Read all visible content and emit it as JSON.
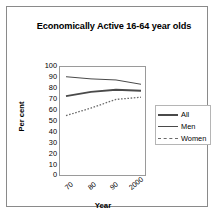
{
  "chart_data": {
    "type": "line",
    "title": "Economically Active 16-64 year olds",
    "xlabel": "Year",
    "ylabel": "Per cent",
    "ylim": [
      0,
      100
    ],
    "ytick_labels": [
      "100",
      "90",
      "80",
      "70",
      "60",
      "50",
      "40",
      "30",
      "20",
      "10",
      "0"
    ],
    "ytick_values": [
      100,
      90,
      80,
      70,
      60,
      50,
      40,
      30,
      20,
      10,
      0
    ],
    "xtick_labels": [
      "70",
      "80",
      "90",
      "2000"
    ],
    "x": [
      1971,
      1981,
      1991,
      2001
    ],
    "grid": false,
    "legend_position": "right",
    "series": [
      {
        "name": "All",
        "style": "solid-thick",
        "values": [
          73,
          77,
          79,
          78
        ]
      },
      {
        "name": "Men",
        "style": "solid-thin",
        "values": [
          91,
          89,
          88,
          84
        ]
      },
      {
        "name": "Women",
        "style": "dotted",
        "values": [
          55,
          62,
          70,
          72
        ]
      }
    ]
  },
  "legend": {
    "items": [
      {
        "label": "All"
      },
      {
        "label": "Men"
      },
      {
        "label": "Women"
      }
    ]
  },
  "colors": {
    "line": "#4a4a4a",
    "axis": "#9a9a9a",
    "border": "#8a8a8a",
    "text": "#000000"
  }
}
